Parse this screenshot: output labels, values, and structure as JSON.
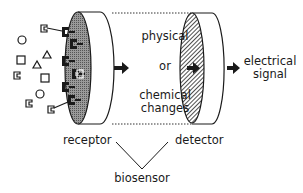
{
  "diagram": {
    "title": "",
    "labels": {
      "physical": "physical",
      "or": "or",
      "chemical": "chemical",
      "changes": "changes",
      "electrical": "electrical",
      "signal": "signal",
      "receptor": "receptor",
      "detector": "detector",
      "biosensor": "biosensor"
    },
    "nodes": [
      {
        "id": "analytes",
        "label": "",
        "shapes": [
          "circle",
          "square",
          "triangle",
          "notched-square"
        ]
      },
      {
        "id": "receptor",
        "label": "receptor",
        "fill": "stippled-gray"
      },
      {
        "id": "transduction",
        "label": "physical or chemical changes"
      },
      {
        "id": "detector",
        "label": "detector",
        "fill": "hatched"
      },
      {
        "id": "output",
        "label": "electrical signal"
      },
      {
        "id": "biosensor",
        "label": "biosensor"
      }
    ],
    "edges": [
      {
        "from": "receptor",
        "to": "transduction",
        "style": "thick-arrow"
      },
      {
        "from": "transduction",
        "to": "detector",
        "style": "thick-arrow"
      },
      {
        "from": "detector",
        "to": "output",
        "style": "thick-arrow"
      },
      {
        "from": "receptor",
        "to": "biosensor",
        "style": "line"
      },
      {
        "from": "detector",
        "to": "biosensor",
        "style": "line"
      }
    ],
    "colors": {
      "ink": "#1a1a1a",
      "receptor_fill": "#8a8a8a",
      "background": "#ffffff"
    }
  }
}
